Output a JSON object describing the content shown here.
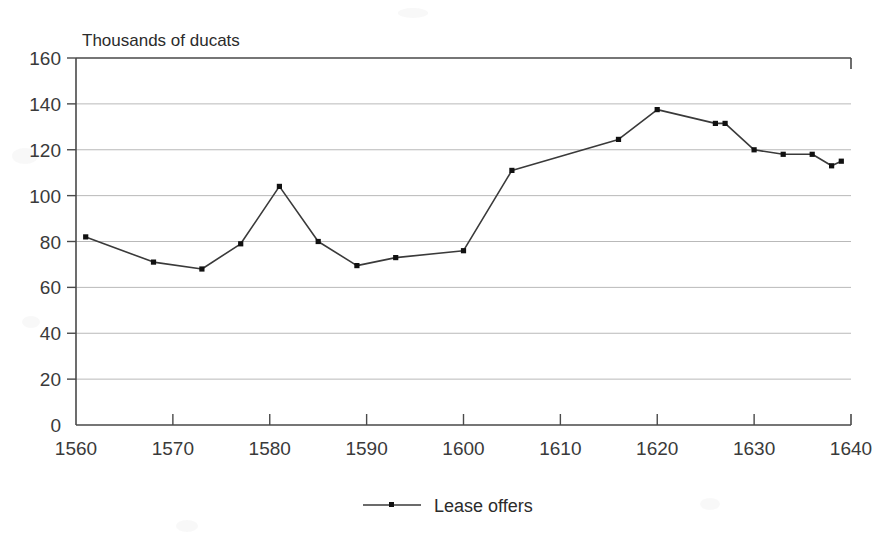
{
  "chart_data": {
    "type": "line",
    "title": "",
    "ylabel": "Thousands of ducats",
    "xlabel": "",
    "xlim": [
      1560,
      1640
    ],
    "ylim": [
      0,
      160
    ],
    "grid": true,
    "legend_position": "bottom-center",
    "y_ticks": [
      0,
      20,
      40,
      60,
      80,
      100,
      120,
      140,
      160
    ],
    "y_tick_labels": [
      "0",
      "20",
      "40",
      "60",
      "80",
      "100",
      "120",
      "140",
      "160"
    ],
    "x_ticks": [
      1560,
      1570,
      1580,
      1590,
      1600,
      1610,
      1620,
      1630,
      1640
    ],
    "x_tick_labels": [
      "1560",
      "1570",
      "1580",
      "1590",
      "1600",
      "1610",
      "1620",
      "1630",
      "1640"
    ],
    "series": [
      {
        "name": "Lease offers",
        "color": "#333333",
        "marker": "square",
        "x": [
          1561,
          1568,
          1573,
          1577,
          1581,
          1585,
          1589,
          1593,
          1600,
          1605,
          1616,
          1620,
          1626,
          1627,
          1630,
          1633,
          1636,
          1638,
          1639
        ],
        "values": [
          82,
          71,
          68,
          79,
          104,
          80,
          69.5,
          73,
          76,
          111,
          124.5,
          137.5,
          131.5,
          131.5,
          120,
          118,
          118,
          113,
          115
        ]
      }
    ]
  },
  "legend": {
    "entries": [
      {
        "label": "Lease offers"
      }
    ]
  },
  "axis": {
    "y_axis_caption": "Thousands of ducats"
  }
}
